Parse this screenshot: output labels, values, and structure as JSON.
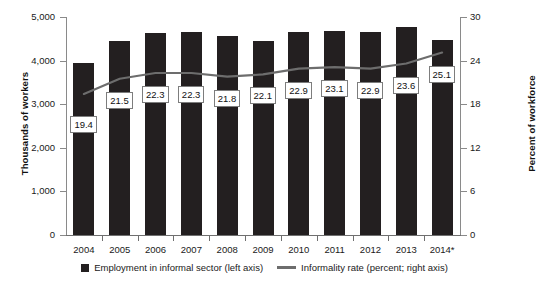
{
  "chart_data": {
    "type": "bar",
    "title": "",
    "categories": [
      "2004",
      "2005",
      "2006",
      "2007",
      "2008",
      "2009",
      "2010",
      "2011",
      "2012",
      "2013",
      "2014*"
    ],
    "series": [
      {
        "name": "Employment in informal sector (left axis)",
        "type": "bar",
        "axis": "left",
        "color": "#231f20",
        "values": [
          3950,
          4440,
          4640,
          4660,
          4570,
          4450,
          4650,
          4680,
          4650,
          4780,
          4470
        ]
      },
      {
        "name": "Informality rate (percent; right axis)",
        "type": "line",
        "axis": "right",
        "color": "#6d6d6d",
        "values": [
          19.4,
          21.5,
          22.3,
          22.3,
          21.8,
          22.1,
          22.9,
          23.1,
          22.9,
          23.6,
          25.1
        ]
      }
    ],
    "ylabel": "Thousands of workers",
    "ylabel_right": "Percent of workforce",
    "xlabel": "",
    "ylim": [
      0,
      5000
    ],
    "ylim_right": [
      0,
      30
    ],
    "yticks": [
      "0",
      "1,000",
      "2,000",
      "3,000",
      "4,000",
      "5,000"
    ],
    "yticks_right": [
      "0",
      "6",
      "12",
      "18",
      "24",
      "30"
    ],
    "grid": false,
    "legend_position": "bottom",
    "data_labels": [
      "19.4",
      "21.5",
      "22.3",
      "22.3",
      "21.8",
      "22.1",
      "22.9",
      "23.1",
      "22.9",
      "23.6",
      "25.1"
    ]
  },
  "legend": {
    "entries": [
      {
        "label": "Employment in informal sector (left axis)",
        "marker": "square"
      },
      {
        "label": "Informality rate (percent; right axis)",
        "marker": "line"
      }
    ]
  }
}
